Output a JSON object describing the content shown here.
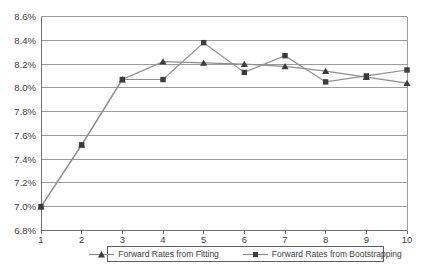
{
  "chart_data": {
    "type": "line",
    "title": "",
    "xlabel": "",
    "ylabel": "",
    "grid": true,
    "legend_position": "bottom",
    "x": [
      1,
      2,
      3,
      4,
      5,
      6,
      7,
      8,
      9,
      10
    ],
    "xtick_labels": [
      "1",
      "2",
      "3",
      "4",
      "5",
      "6",
      "7",
      "8",
      "9",
      "10"
    ],
    "ylim": [
      6.8,
      8.6
    ],
    "ytick_step": 0.2,
    "ytick_labels": [
      "6.8%",
      "7.0%",
      "7.2%",
      "7.4%",
      "7.6%",
      "7.8%",
      "8.0%",
      "8.2%",
      "8.4%",
      "8.6%"
    ],
    "series": [
      {
        "name": "Forward Rates from Fitting",
        "marker": "triangle",
        "values": [
          7.0,
          7.52,
          8.07,
          8.22,
          8.21,
          8.2,
          8.18,
          8.14,
          8.09,
          8.04
        ]
      },
      {
        "name": "Forward Rates from Bootstrapping",
        "marker": "square",
        "values": [
          7.0,
          7.52,
          8.07,
          8.07,
          8.38,
          8.13,
          8.27,
          8.05,
          8.1,
          8.15
        ]
      }
    ],
    "colors": {
      "line": "#8e8e8e",
      "marker": "#3c3c3c",
      "grid": "#9c9c9c",
      "axis": "#6e6e6e",
      "text": "#404040",
      "background": "#ffffff",
      "legend_border": "#5f5f5f"
    }
  }
}
